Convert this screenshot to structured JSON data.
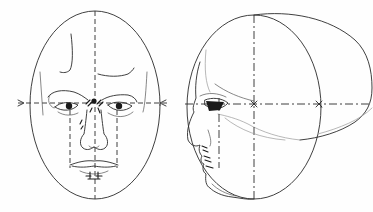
{
  "figure": {
    "views": [
      {
        "name": "front-view",
        "shape": "oval",
        "guides": [
          "vertical-center-line",
          "horizontal-eye-line",
          "eye-drop-lines"
        ]
      },
      {
        "name": "profile-view",
        "shape": "circle-with-cranium-extension",
        "guides": [
          "vertical-center-line",
          "horizontal-eye-line"
        ]
      }
    ],
    "colors": {
      "ink": "#2a2a2a",
      "background": "#fefefe"
    }
  }
}
